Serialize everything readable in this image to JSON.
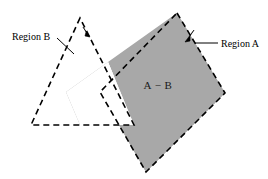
{
  "figure": {
    "background_color": "#ffffff",
    "shade_color": "#a8a8a8",
    "stroke_color": "#000000",
    "width": 268,
    "height": 179
  },
  "labels": {
    "region_b": "Region B",
    "region_a": "Region A",
    "difference": "A − B"
  },
  "shapes": {
    "region_a": {
      "name": "Region A",
      "kind": "quadrilateral",
      "style": "dashed outline, gray shaded",
      "vertices": [
        [
          177,
          13
        ],
        [
          225,
          93
        ],
        [
          146,
          172
        ],
        [
          100,
          92
        ]
      ]
    },
    "region_b": {
      "name": "Region B",
      "kind": "triangle",
      "style": "dashed outline, unfilled",
      "vertices": [
        [
          80,
          18
        ],
        [
          31,
          125
        ],
        [
          134,
          125
        ]
      ]
    },
    "subtracted_overlap": {
      "name": "A intersect B (removed from shading)",
      "style": "white, unfilled",
      "vertices": [
        [
          108,
          62
        ],
        [
          134,
          125
        ],
        [
          80,
          125
        ],
        [
          66,
          92
        ]
      ]
    }
  },
  "leaders": {
    "region_b": {
      "from": [
        57,
        38
      ],
      "to": [
        73,
        53
      ]
    },
    "region_a": {
      "from": [
        218,
        43
      ],
      "to": [
        196,
        43
      ]
    }
  },
  "arrow_markers": [
    {
      "name": "arrow-on-region-b-edge",
      "at": [
        87,
        33
      ],
      "direction": "down-right"
    },
    {
      "name": "arrow-on-region-a-edge",
      "at": [
        189,
        37
      ],
      "direction": "up-right"
    }
  ]
}
